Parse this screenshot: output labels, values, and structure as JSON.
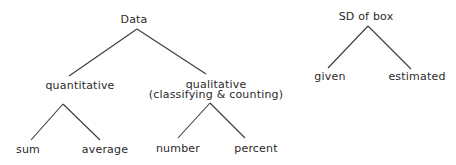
{
  "diagram": {
    "type": "tree",
    "trees": [
      {
        "root": "Data",
        "children": [
          {
            "label": "quantitative",
            "children": [
              {
                "label": "sum"
              },
              {
                "label": "average"
              }
            ]
          },
          {
            "label": "qualitative",
            "sublabel": "(classifying & counting)",
            "children": [
              {
                "label": "number"
              },
              {
                "label": "percent"
              }
            ]
          }
        ]
      },
      {
        "root": "SD of box",
        "children": [
          {
            "label": "given"
          },
          {
            "label": "estimated"
          }
        ]
      }
    ]
  },
  "colors": {
    "line": "#3a3a3a",
    "text": "#2a2a2a",
    "background": "#ffffff"
  }
}
